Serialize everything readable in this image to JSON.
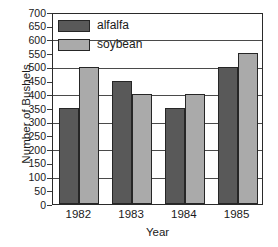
{
  "chart_data": {
    "type": "bar",
    "title": "",
    "xlabel": "Year",
    "ylabel": "Number of Bushels",
    "categories": [
      "1982",
      "1983",
      "1984",
      "1985"
    ],
    "series": [
      {
        "name": "alfalfa",
        "color": "#595959",
        "values": [
          350,
          450,
          350,
          500
        ]
      },
      {
        "name": "soybean",
        "color": "#aaaaaa",
        "values": [
          500,
          400,
          400,
          550
        ]
      }
    ],
    "ylim": [
      0,
      700
    ],
    "ytick_step": 50,
    "yticks": [
      0,
      50,
      100,
      150,
      200,
      250,
      300,
      350,
      400,
      450,
      500,
      550,
      600,
      650,
      700
    ],
    "ytick_labels": [
      "0",
      "50",
      "100",
      "150",
      "200",
      "250",
      "300",
      "350",
      "400",
      "450",
      "500",
      "550",
      "600",
      "650",
      "700"
    ],
    "gridlines": [
      100,
      200,
      300,
      400,
      500,
      600,
      700
    ],
    "grid": true,
    "legend_position": "top-left-inside",
    "legend_entries": [
      "alfalfa",
      "soybean"
    ]
  }
}
